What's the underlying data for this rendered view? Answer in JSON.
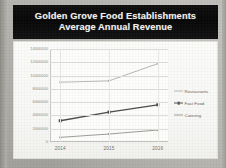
{
  "slide": {
    "title_line_1": "Golden Grove Food Establishments",
    "title_line_2": "Average Annual Revenue",
    "title_band_color": "#0a0a0a",
    "title_text_color": "#f2f1ef",
    "chart_panel_color": "#fbfbfa"
  },
  "chart_data": {
    "type": "line",
    "title": "Golden Grove Food Establishments Average Annual Revenue",
    "subtitle": "Average Annual Revenue",
    "xlabel": "",
    "ylabel": "",
    "categories": [
      "2014",
      "2015",
      "2016"
    ],
    "series": [
      {
        "name": "Restaurants",
        "values": [
          9000000,
          9200000,
          11800000
        ],
        "color": "#b6b6b2",
        "marker": "none",
        "line_width": 1
      },
      {
        "name": "Fast Food",
        "values": [
          3200000,
          4500000,
          5600000
        ],
        "color": "#4a4a48",
        "marker": "square",
        "line_width": 1.3
      },
      {
        "name": "Catering",
        "values": [
          700000,
          1200000,
          1800000
        ],
        "color": "#9c9c98",
        "marker": "none",
        "line_width": 1
      }
    ],
    "ylim": [
      0,
      14000000
    ],
    "ytick_values": [
      14000000,
      12000000,
      10000000,
      8000000,
      6000000,
      4000000,
      2000000,
      0
    ],
    "ytick_labels": [
      "14000000",
      "12000000",
      "10000000",
      "8000000",
      "6000000",
      "4000000",
      "2000000",
      "0"
    ],
    "xtick_labels": [
      "2014",
      "2015",
      "2016"
    ],
    "grid": "horizontal",
    "legend_position": "right",
    "legend_entries": [
      "Restaurants",
      "Fast Food",
      "Catering"
    ]
  }
}
